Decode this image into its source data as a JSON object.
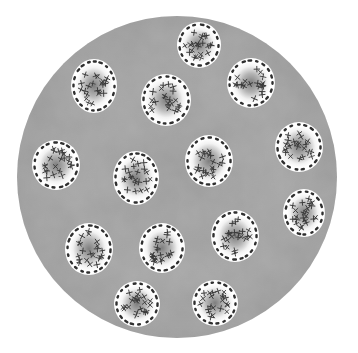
{
  "figure": {
    "kind": "microscope-field-illustration",
    "width": 358,
    "height": 353,
    "background_color": "#ffffff"
  },
  "field": {
    "cx": 177,
    "cy": 177,
    "rx": 160,
    "ry": 161,
    "fill_color": "#a2a2a2",
    "shade_color": "#8e8e8e"
  },
  "cell_style": {
    "fill_color": "#ffffff",
    "dash_color": "#2e2e2e",
    "center_shade_color": "#8a8a8a",
    "chromosome_color": "#3a3a3a"
  },
  "cells": [
    {
      "id": "cell-top",
      "cx": 199,
      "cy": 45,
      "rx": 22,
      "ry": 23
    },
    {
      "id": "cell-upper-left",
      "cx": 94,
      "cy": 86,
      "rx": 23,
      "ry": 27
    },
    {
      "id": "cell-upper-middle",
      "cx": 166,
      "cy": 100,
      "rx": 25,
      "ry": 26
    },
    {
      "id": "cell-upper-right",
      "cx": 251,
      "cy": 83,
      "rx": 24,
      "ry": 25
    },
    {
      "id": "cell-mid-left",
      "cx": 56,
      "cy": 165,
      "rx": 24,
      "ry": 25
    },
    {
      "id": "cell-center-left",
      "cx": 136,
      "cy": 178,
      "rx": 23,
      "ry": 27
    },
    {
      "id": "cell-center",
      "cx": 209,
      "cy": 161,
      "rx": 24,
      "ry": 26
    },
    {
      "id": "cell-mid-right",
      "cx": 299,
      "cy": 147,
      "rx": 24,
      "ry": 25
    },
    {
      "id": "cell-right-lower",
      "cx": 304,
      "cy": 213,
      "rx": 21,
      "ry": 24
    },
    {
      "id": "cell-lower-center-right",
      "cx": 235,
      "cy": 236,
      "rx": 24,
      "ry": 26
    },
    {
      "id": "cell-lower-left",
      "cx": 89,
      "cy": 249,
      "rx": 24,
      "ry": 26
    },
    {
      "id": "cell-lower-middle",
      "cx": 162,
      "cy": 248,
      "rx": 23,
      "ry": 25
    },
    {
      "id": "cell-bottom-left",
      "cx": 137,
      "cy": 304,
      "rx": 23,
      "ry": 23
    },
    {
      "id": "cell-bottom-right",
      "cx": 215,
      "cy": 303,
      "rx": 23,
      "ry": 23
    }
  ]
}
